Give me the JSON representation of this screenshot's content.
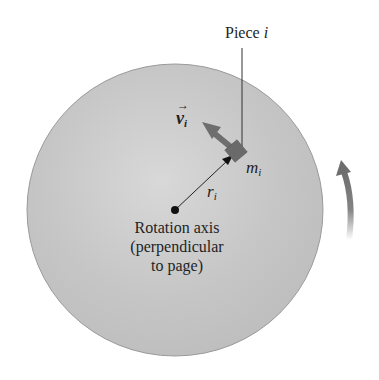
{
  "diagram": {
    "piece_label": {
      "text": "Piece ",
      "var": "i"
    },
    "velocity_label": {
      "base": "v",
      "sub": "i",
      "vector": true
    },
    "mass_label": {
      "base": "m",
      "sub": "i"
    },
    "radius_label": {
      "base": "r",
      "sub": "i"
    },
    "axis_label": {
      "line1": "Rotation axis",
      "line2": "(perpendicular",
      "line3": "to page)"
    },
    "colors": {
      "disk_fill": "#c8c8c8",
      "disk_edge": "#9a9a9a",
      "arrow_gray": "#6e6e6e",
      "mass_block": "#6a6a6a",
      "ink": "#1f1f1f"
    }
  }
}
